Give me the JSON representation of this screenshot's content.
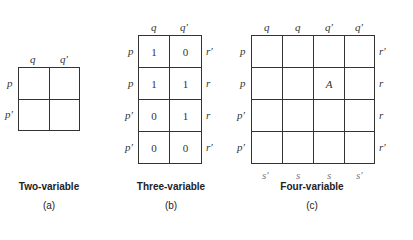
{
  "diagrams": [
    {
      "title": "Two-variable",
      "sublabel": "(a)",
      "col_labels": [
        "q",
        "q′"
      ],
      "row_labels": [
        "p",
        "p′"
      ],
      "cells": [
        [
          "",
          ""
        ],
        [
          "",
          ""
        ]
      ]
    },
    {
      "title": "Three-variable",
      "sublabel": "(b)",
      "col_labels": [
        "q",
        "q′"
      ],
      "row_labels": [
        "p",
        "p",
        "p′",
        "p′"
      ],
      "right_labels": [
        "r′",
        "r",
        "r",
        "r′"
      ],
      "cells": [
        [
          "1",
          "0"
        ],
        [
          "1",
          "1"
        ],
        [
          "0",
          "1"
        ],
        [
          "0",
          "0"
        ]
      ]
    },
    {
      "title": "Four-variable",
      "sublabel": "(c)",
      "col_labels": [
        "q",
        "q",
        "q′",
        "q′"
      ],
      "row_labels": [
        "p",
        "p",
        "p′",
        "p′"
      ],
      "right_labels": [
        "r′",
        "r",
        "r",
        "r′"
      ],
      "bottom_labels": [
        "s′",
        "s",
        "s",
        "s′"
      ],
      "cells": [
        [
          "",
          "",
          "",
          ""
        ],
        [
          "",
          "",
          "A",
          ""
        ],
        [
          "",
          "",
          "",
          ""
        ],
        [
          "",
          "",
          "",
          ""
        ]
      ]
    }
  ]
}
